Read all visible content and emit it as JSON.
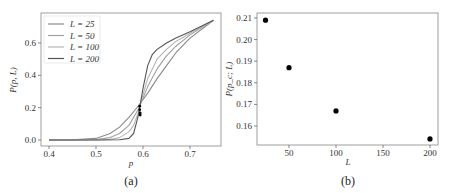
{
  "chart_data": [
    {
      "id": "a",
      "type": "line",
      "caption": "(a)",
      "xlabel": "p",
      "ylabel": "P(p, L)",
      "xlim": [
        0.38,
        0.76
      ],
      "ylim": [
        -0.02,
        0.76
      ],
      "xticks": [
        "0.4",
        "0.5",
        "0.6",
        "0.7"
      ],
      "yticks": [
        "0.0",
        "0.2",
        "0.4",
        "0.6"
      ],
      "grid": false,
      "legend_position": "upper left",
      "legend": [
        "L = 25",
        "L = 50",
        "L = 100",
        "L = 200"
      ],
      "series": [
        {
          "name": "L = 25",
          "color": "#8a8a8a",
          "x": [
            0.4,
            0.45,
            0.5,
            0.53,
            0.55,
            0.57,
            0.59,
            0.61,
            0.63,
            0.65,
            0.67,
            0.7,
            0.75
          ],
          "y": [
            0.0,
            0.001,
            0.01,
            0.04,
            0.08,
            0.14,
            0.21,
            0.29,
            0.38,
            0.46,
            0.54,
            0.63,
            0.74
          ]
        },
        {
          "name": "L = 50",
          "color": "#a0a0a0",
          "x": [
            0.4,
            0.45,
            0.5,
            0.53,
            0.55,
            0.57,
            0.59,
            0.61,
            0.63,
            0.65,
            0.67,
            0.7,
            0.75
          ],
          "y": [
            0.0,
            0.0,
            0.003,
            0.015,
            0.04,
            0.09,
            0.19,
            0.33,
            0.44,
            0.52,
            0.58,
            0.65,
            0.74
          ]
        },
        {
          "name": "L = 100",
          "color": "#b5b5b5",
          "x": [
            0.4,
            0.45,
            0.5,
            0.53,
            0.55,
            0.57,
            0.58,
            0.59,
            0.6,
            0.61,
            0.63,
            0.65,
            0.67,
            0.7,
            0.75
          ],
          "y": [
            0.0,
            0.0,
            0.0,
            0.004,
            0.015,
            0.05,
            0.09,
            0.17,
            0.28,
            0.38,
            0.5,
            0.56,
            0.61,
            0.66,
            0.74
          ]
        },
        {
          "name": "L = 200",
          "color": "#555555",
          "x": [
            0.4,
            0.45,
            0.5,
            0.55,
            0.57,
            0.58,
            0.59,
            0.6,
            0.61,
            0.62,
            0.63,
            0.65,
            0.67,
            0.7,
            0.75
          ],
          "y": [
            0.0,
            0.0,
            0.0,
            0.002,
            0.01,
            0.04,
            0.15,
            0.32,
            0.46,
            0.53,
            0.56,
            0.6,
            0.63,
            0.67,
            0.74
          ]
        }
      ],
      "markers": {
        "x": [
          0.593,
          0.593,
          0.594,
          0.594
        ],
        "y": [
          0.209,
          0.187,
          0.167,
          0.154
        ],
        "color": "#000000"
      }
    },
    {
      "id": "b",
      "type": "scatter",
      "caption": "(b)",
      "xlabel": "L",
      "ylabel": "P(p_c; L)",
      "xlim": [
        15,
        210
      ],
      "ylim": [
        0.152,
        0.2115
      ],
      "xticks": [
        "50",
        "100",
        "150",
        "200"
      ],
      "yticks": [
        "0.16",
        "0.17",
        "0.18",
        "0.19",
        "0.20",
        "0.21"
      ],
      "grid": false,
      "categories": [
        25,
        50,
        100,
        200
      ],
      "values": [
        0.209,
        0.187,
        0.167,
        0.154
      ],
      "color": "#000000"
    }
  ]
}
